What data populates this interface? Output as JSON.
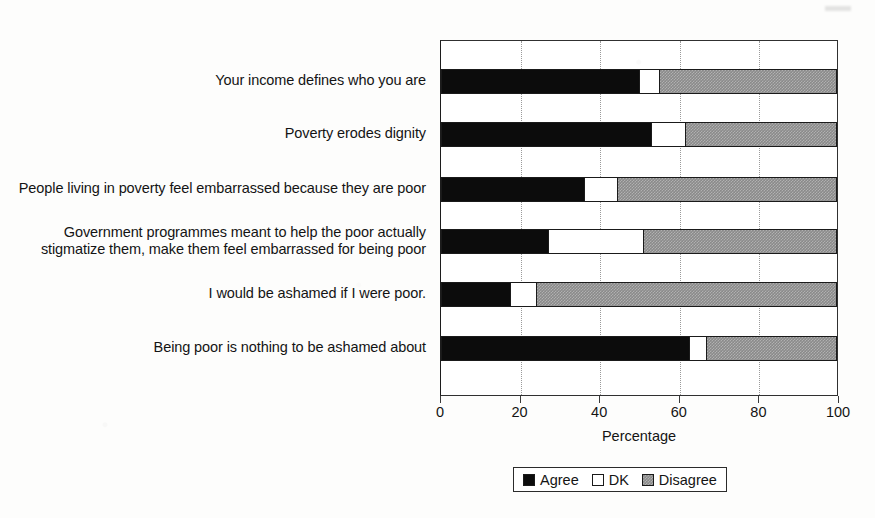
{
  "chart_data": {
    "type": "bar",
    "orientation": "horizontal",
    "stacked": true,
    "stacked_percent": true,
    "title": "",
    "xlabel": "Percentage",
    "ylabel": "",
    "xlim": [
      0,
      100
    ],
    "xticks": [
      0,
      20,
      40,
      60,
      80,
      100
    ],
    "xtick_labels": [
      "0",
      "20",
      "40",
      "60",
      "80",
      "100"
    ],
    "grid": "vertical-dotted",
    "legend_position": "bottom-center",
    "categories": [
      "Your income defines who you are",
      "Poverty erodes dignity",
      "People living in poverty feel embarrassed because they are poor",
      "Government programmes meant to help the poor actually stigmatize them, make them feel embarrassed for being poor",
      "I would be ashamed if I were poor.",
      "Being poor is nothing to be ashamed about"
    ],
    "series": [
      {
        "name": "Agree",
        "color": "#0c0c0c",
        "values": [
          50,
          53,
          36,
          27,
          17.5,
          62.5
        ]
      },
      {
        "name": "DK",
        "color": "#ffffff",
        "values": [
          5,
          8.5,
          8.5,
          24,
          6.5,
          4.5
        ]
      },
      {
        "name": "Disagree",
        "color": "#8a8a8a",
        "values": [
          45,
          38.5,
          55.5,
          49,
          76,
          33
        ]
      }
    ]
  },
  "axis": {
    "x_title": "Percentage"
  },
  "legend": {
    "items": [
      {
        "label": "Agree"
      },
      {
        "label": "DK"
      },
      {
        "label": "Disagree"
      }
    ]
  }
}
